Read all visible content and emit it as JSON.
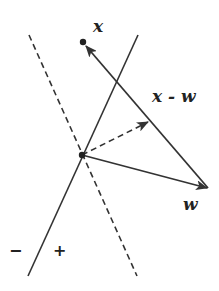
{
  "diagram": {
    "title": "",
    "colors": {
      "stroke": "#333333",
      "background": "#ffffff"
    },
    "points": {
      "origin": {
        "x": 82,
        "y": 155
      },
      "x_point": {
        "x": 83,
        "y": 42
      },
      "w_tip": {
        "x": 208,
        "y": 188
      },
      "projection_tip": {
        "x": 149,
        "y": 122
      }
    },
    "lines": {
      "decision_boundary": {
        "style": "solid",
        "from": [
          138,
          35
        ],
        "to": [
          28,
          276
        ]
      },
      "perpendicular": {
        "style": "dashed",
        "from": [
          29,
          35
        ],
        "to": [
          137,
          276
        ]
      }
    },
    "arrows": [
      {
        "name": "w",
        "style": "solid",
        "from": "origin",
        "to": "w_tip"
      },
      {
        "name": "x - w",
        "style": "solid",
        "from": "w_tip",
        "to": "x_point"
      },
      {
        "name": "projection",
        "style": "dashed",
        "from": "origin",
        "to": "projection_tip"
      }
    ],
    "labels": {
      "x": "x",
      "x_minus_w": "x - w",
      "w": "w",
      "minus": "−",
      "plus": "+"
    }
  }
}
